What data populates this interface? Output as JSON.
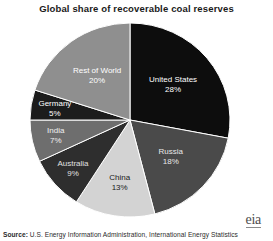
{
  "chart_data": {
    "type": "pie",
    "title": "Global share of recoverable coal reserves",
    "xlabel": "",
    "ylabel": "",
    "legend_position": "none",
    "grid": false,
    "unit": "%",
    "categories": [
      "United States",
      "Russia",
      "China",
      "Australia",
      "India",
      "Germany",
      "Rest of World"
    ],
    "values": [
      28,
      18,
      13,
      9,
      7,
      5,
      20
    ],
    "slices": [
      {
        "label": "United States",
        "value": 28,
        "value_text": "28%",
        "color": "#0d0d0d",
        "text_color": "#ffffff"
      },
      {
        "label": "Russia",
        "value": 18,
        "value_text": "18%",
        "color": "#4a4a4a",
        "text_color": "#e8e8e8"
      },
      {
        "label": "China",
        "value": 13,
        "value_text": "13%",
        "color": "#d3d3d3",
        "text_color": "#1a1a1a"
      },
      {
        "label": "Australia",
        "value": 9,
        "value_text": "9%",
        "color": "#2e2e2e",
        "text_color": "#e0e0e0"
      },
      {
        "label": "India",
        "value": 7,
        "value_text": "7%",
        "color": "#6e6e6e",
        "text_color": "#f0f0f0"
      },
      {
        "label": "Germany",
        "value": 5,
        "value_text": "5%",
        "color": "#1c1c1c",
        "text_color": "#ffffff"
      },
      {
        "label": "Rest of World",
        "value": 20,
        "value_text": "20%",
        "color": "#8f8f8f",
        "text_color": "#ffffff"
      }
    ]
  },
  "footer": {
    "source_prefix": "Source:",
    "source_text": "U.S. Energy Information Administration, International Energy Statistics",
    "logo_text": "eia"
  }
}
